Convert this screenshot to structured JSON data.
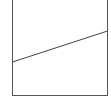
{
  "diagram": {
    "type": "line-in-box",
    "frame": {
      "left": 12,
      "right": 107,
      "top": 0,
      "bottom": 95,
      "stroke": "#555555",
      "open_top": true
    },
    "line": {
      "x1": 12,
      "y1": 62,
      "x2": 107,
      "y2": 31,
      "stroke": "#444444"
    }
  }
}
